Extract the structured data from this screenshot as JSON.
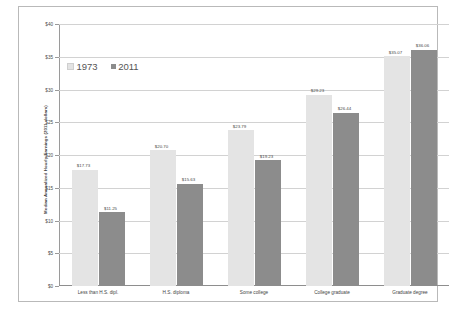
{
  "chart_data": {
    "type": "bar",
    "title": "",
    "xlabel": "",
    "ylabel": "Median Annualized Hourly Earnings (2011 dollars)",
    "categories": [
      "Less than H.S. dipl.",
      "H.S. diploma",
      "Some college",
      "College graduate",
      "Graduate degree"
    ],
    "series": [
      {
        "name": "1973",
        "color": "#e4e4e4",
        "values": [
          17.73,
          20.7,
          23.79,
          29.23,
          35.07
        ],
        "labels": [
          "$17.73",
          "$20.70",
          "$23.79",
          "$29.23",
          "$35.07"
        ]
      },
      {
        "name": "2011",
        "color": "#8c8c8c",
        "values": [
          11.25,
          15.63,
          19.23,
          26.44,
          36.06
        ],
        "labels": [
          "$11.25",
          "$15.63",
          "$19.23",
          "$26.44",
          "$36.06"
        ]
      }
    ],
    "ylim": [
      0,
      40
    ],
    "yticks": [
      0,
      5,
      10,
      15,
      20,
      25,
      30,
      35,
      40
    ],
    "ytick_labels": [
      "$0",
      "$5",
      "$10",
      "$15",
      "$20",
      "$25",
      "$30",
      "$35",
      "$40"
    ],
    "grid": "horizontal",
    "legend_position": "upper-left-inside"
  },
  "legend": {
    "entries": [
      {
        "label": "1973"
      },
      {
        "label": "2011"
      }
    ]
  }
}
